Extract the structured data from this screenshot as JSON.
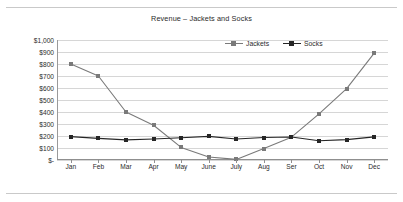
{
  "chart_data": {
    "type": "line",
    "title": "Revenue – Jackets and Socks",
    "xlabel": "",
    "ylabel": "",
    "ylim": [
      0,
      1000
    ],
    "ytick_step": 100,
    "grid": "horizontal",
    "legend_position": "top-center",
    "categories": [
      "Jan",
      "Feb",
      "Mar",
      "Apr",
      "May",
      "June",
      "July",
      "Aug",
      "Ser",
      "Oct",
      "Nov",
      "Dec"
    ],
    "ytick_labels": [
      "$1,000",
      "$900",
      "$800",
      "$700",
      "$600",
      "$500",
      "$400",
      "$300",
      "$200",
      "$100",
      "$-"
    ],
    "ytick_values": [
      1000,
      900,
      800,
      700,
      600,
      500,
      400,
      300,
      200,
      100,
      0
    ],
    "series": [
      {
        "name": "Jackets",
        "color": "#7a7a7a",
        "marker": "square",
        "values": [
          800,
          700,
          400,
          290,
          105,
          25,
          5,
          95,
          190,
          385,
          595,
          890
        ]
      },
      {
        "name": "Socks",
        "color": "#262626",
        "marker": "square",
        "values": [
          195,
          180,
          168,
          175,
          185,
          197,
          175,
          187,
          192,
          160,
          170,
          193
        ]
      }
    ]
  },
  "colors": {
    "background": "#ffffff",
    "gridline": "#d6d6d6",
    "axis": "#8f8f8f",
    "text": "#2b2b2b",
    "jackets": "#7a7a7a",
    "socks": "#262626"
  }
}
